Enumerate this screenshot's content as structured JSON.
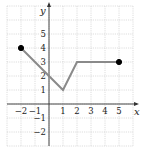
{
  "chart_data": {
    "type": "line",
    "title": "",
    "xlabel": "x",
    "ylabel": "y",
    "xlim": [
      -3,
      6
    ],
    "ylim": [
      -3,
      7
    ],
    "grid": true,
    "x_ticks": [
      -2,
      -1,
      1,
      2,
      3,
      4,
      5
    ],
    "y_ticks": [
      -2,
      -1,
      1,
      2,
      3,
      4,
      5
    ],
    "x_tick_labels": [
      "−2",
      "−1",
      "1",
      "2",
      "3",
      "4",
      "5"
    ],
    "y_tick_labels": [
      "−2",
      "−1",
      "1",
      "2",
      "3",
      "4",
      "5"
    ],
    "series": [
      {
        "name": "f",
        "points": [
          [
            -2,
            4
          ],
          [
            1,
            1
          ],
          [
            2,
            3
          ],
          [
            5,
            3
          ]
        ],
        "color": "#8a8a8a"
      }
    ],
    "endpoints": [
      {
        "x": -2,
        "y": 4,
        "filled": true
      },
      {
        "x": 5,
        "y": 3,
        "filled": true
      }
    ]
  }
}
